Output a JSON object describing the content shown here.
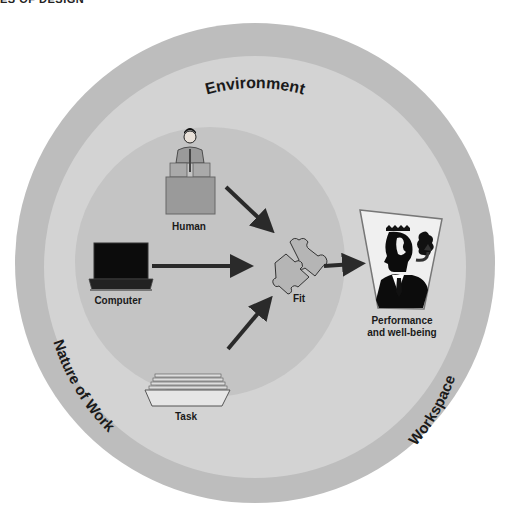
{
  "header": {
    "text": "ES OF DESIGN"
  },
  "rings": {
    "outer": {
      "label": "Environment",
      "color": "#bdbdbd"
    },
    "middle": {
      "color": "#d2d2d2"
    },
    "inner": {
      "color": "#c4c4c4"
    },
    "left_label": "Nature of Work",
    "right_label": "Workspace"
  },
  "nodes": {
    "human": {
      "label": "Human",
      "icon": "person-at-desk-icon"
    },
    "computer": {
      "label": "Computer",
      "icon": "laptop-icon"
    },
    "task": {
      "label": "Task",
      "icon": "paper-tray-icon"
    },
    "fit": {
      "label": "Fit",
      "icon": "puzzle-pieces-icon"
    },
    "outcome": {
      "label_line1": "Performance",
      "label_line2": "and well-being",
      "icon": "businessman-silhouette-icon"
    }
  },
  "colors": {
    "arrow": "#2a2a2a",
    "text": "#1a1a1a"
  }
}
